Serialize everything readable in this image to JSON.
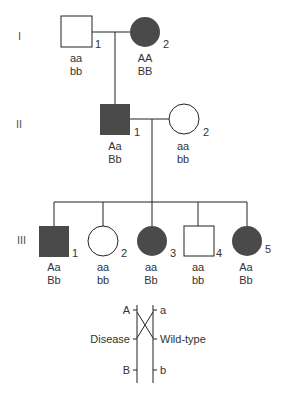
{
  "colors": {
    "affected": "#4a4a4a",
    "line": "#222222",
    "text": "#333333"
  },
  "generations": [
    "I",
    "II",
    "III"
  ],
  "gen1": [
    {
      "id": "1",
      "sex": "male",
      "affected": false,
      "geno1": "aa",
      "geno2": "bb"
    },
    {
      "id": "2",
      "sex": "female",
      "affected": true,
      "geno1": "AA",
      "geno2": "BB"
    }
  ],
  "gen2": [
    {
      "id": "1",
      "sex": "male",
      "affected": true,
      "geno1": "Aa",
      "geno2": "Bb"
    },
    {
      "id": "2",
      "sex": "female",
      "affected": false,
      "geno1": "aa",
      "geno2": "bb"
    }
  ],
  "gen3": [
    {
      "id": "1",
      "sex": "male",
      "affected": true,
      "geno1": "Aa",
      "geno2": "Bb"
    },
    {
      "id": "2",
      "sex": "female",
      "affected": false,
      "geno1": "aa",
      "geno2": "bb"
    },
    {
      "id": "3",
      "sex": "female",
      "affected": true,
      "geno1": "aa",
      "geno2": "Bb"
    },
    {
      "id": "4",
      "sex": "male",
      "affected": false,
      "geno1": "aa",
      "geno2": "bb"
    },
    {
      "id": "5",
      "sex": "female",
      "affected": true,
      "geno1": "Aa",
      "geno2": "Bb"
    }
  ],
  "chromosome": {
    "left_top": "A",
    "right_top": "a",
    "left_mid": "Disease",
    "right_mid": "Wild-type",
    "left_bot": "B",
    "right_bot": "b"
  }
}
